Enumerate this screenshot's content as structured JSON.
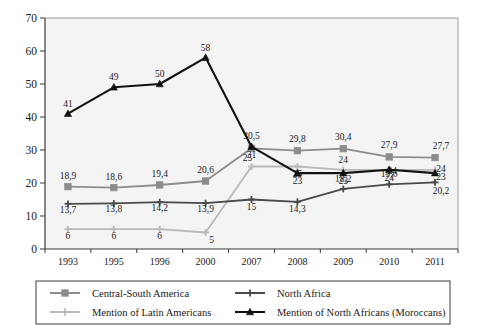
{
  "chart_data": {
    "type": "line",
    "title": "",
    "subtitle": "",
    "xlabel": "",
    "ylabel": "",
    "categories": [
      "1993",
      "1995",
      "1996",
      "2000",
      "2007",
      "2008",
      "2009",
      "2010",
      "2011"
    ],
    "ylim": [
      0,
      70
    ],
    "yticks": [
      0,
      10,
      20,
      30,
      40,
      50,
      60,
      70
    ],
    "ytick_labels": [
      "0",
      "10",
      "20",
      "30",
      "40",
      "50",
      "60",
      "70"
    ],
    "grid": false,
    "legend_position": "bottom",
    "series": [
      {
        "name": "Central-South America",
        "color": "#8c8c8c",
        "marker": "square",
        "values": [
          18.9,
          18.6,
          19.4,
          20.6,
          30.5,
          29.8,
          30.4,
          27.9,
          27.7
        ],
        "labels": [
          "18,9",
          "18,6",
          "19,4",
          "20,6",
          "30,5",
          "29,8",
          "30,4",
          "27,9",
          "27,7"
        ]
      },
      {
        "name": "North Africa",
        "color": "#4a4a4a",
        "marker": "plus",
        "values": [
          13.7,
          13.8,
          14.2,
          13.9,
          15,
          14.3,
          18.2,
          19.6,
          20.2
        ],
        "labels": [
          "13,7",
          "13,8",
          "14,2",
          "13,9",
          "15",
          "14,3",
          "18,2",
          "19,6",
          "20,2"
        ]
      },
      {
        "name": "Mention of Latin Americans",
        "color": "#b9b9b9",
        "marker": "plus",
        "values": [
          6,
          6,
          6,
          5,
          25,
          25,
          24,
          24,
          24
        ],
        "labels": [
          "6",
          "6",
          "6",
          "5",
          "25",
          "25",
          "24",
          "24",
          "24"
        ]
      },
      {
        "name": "Mention of North Africans (Moroccans)",
        "color": "#111111",
        "marker": "triangle",
        "values": [
          41,
          49,
          50,
          58,
          31,
          23,
          23,
          24,
          23
        ],
        "labels": [
          "41",
          "49",
          "50",
          "58",
          "31",
          "23",
          "23",
          "24",
          "23"
        ]
      }
    ]
  },
  "legend": {
    "entries": [
      {
        "label": "Central-South America"
      },
      {
        "label": "North Africa"
      },
      {
        "label": "Mention of Latin Americans"
      },
      {
        "label": "Mention of North Africans (Moroccans)"
      }
    ]
  }
}
